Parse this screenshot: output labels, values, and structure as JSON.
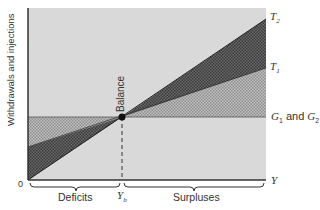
{
  "diagram": {
    "y_axis_label": "Withdrawals and injections",
    "x_axis_label": "Y",
    "origin_label": "0",
    "equilibrium_label": "Balance",
    "equilibrium_x_label": "Y",
    "equilibrium_x_subscript": "b",
    "lines": [
      {
        "name": "T",
        "subscript": "2",
        "description": "steeper tax/withdrawal line"
      },
      {
        "name": "T",
        "subscript": "1",
        "description": "flatter tax/withdrawal line"
      },
      {
        "name": "G",
        "subscript": "1",
        "joiner": " and ",
        "name2": "G",
        "subscript2": "2",
        "description": "horizontal government spending line"
      }
    ],
    "regions": {
      "left": "Deficits",
      "right": "Surpluses"
    },
    "colors": {
      "background": "#d9d9d9",
      "dark_wedge": "#555555",
      "light_hatch": "#a8a8a8",
      "axis": "#333333"
    }
  }
}
